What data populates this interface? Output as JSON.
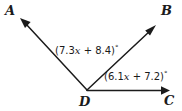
{
  "figure": {
    "type": "geometry-diagram",
    "background_color": "#ffffff",
    "stroke_color": "#1b1b1b",
    "points": {
      "a": "A",
      "b": "B",
      "c": "C",
      "d": "D"
    },
    "angles": [
      {
        "id": "angle-adb",
        "text_prefix": "(7.3",
        "text_var": "x",
        "text_middle": " + 8.4)",
        "degree_symbol": "°",
        "full_text": "(7.3x + 8.4)°",
        "expression": "7.3x + 8.4",
        "between_rays": "DA and DB"
      },
      {
        "id": "angle-bdc",
        "text_prefix": "(6.1",
        "text_var": "x",
        "text_middle": " + 7.2)",
        "degree_symbol": "°",
        "full_text": "(6.1x + 7.2)°",
        "expression": "6.1x + 7.2",
        "between_rays": "DB and DC"
      }
    ],
    "rays": [
      {
        "id": "ray-da",
        "from": "D",
        "to": "A",
        "arrow": "end"
      },
      {
        "id": "ray-db",
        "from": "D",
        "to": "B",
        "arrow": "end"
      },
      {
        "id": "ray-dc",
        "from": "D",
        "to": "C",
        "arrow": "end"
      }
    ]
  }
}
